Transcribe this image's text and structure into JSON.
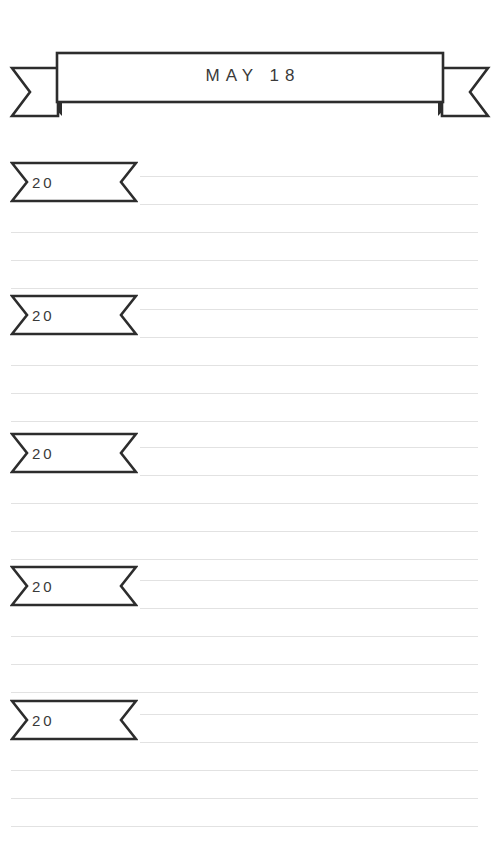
{
  "page": {
    "background_color": "#ffffff",
    "width": 500,
    "height": 855,
    "kind": "memory-book-page"
  },
  "header": {
    "title": "MAY 18",
    "ribbon_icon": "banner-ribbon-icon",
    "stroke_color": "#2d2d2d",
    "text_color": "#3a3a3a"
  },
  "styles": {
    "rule_color": "#e2e2e2",
    "ribbon_stroke": "#2d2d2d",
    "ribbon_fill": "#ffffff"
  },
  "entries": [
    {
      "year_label": "20",
      "ribbon_icon": "year-ribbon-icon",
      "top": 160,
      "rules": [
        {
          "type": "short",
          "y": 16
        },
        {
          "type": "short",
          "y": 44
        },
        {
          "type": "full",
          "y": 72
        },
        {
          "type": "full",
          "y": 100
        },
        {
          "type": "full",
          "y": 128
        }
      ]
    },
    {
      "year_label": "20",
      "ribbon_icon": "year-ribbon-icon",
      "top": 293,
      "rules": [
        {
          "type": "short",
          "y": 16
        },
        {
          "type": "short",
          "y": 44
        },
        {
          "type": "full",
          "y": 72
        },
        {
          "type": "full",
          "y": 100
        },
        {
          "type": "full",
          "y": 128
        }
      ]
    },
    {
      "year_label": "20",
      "ribbon_icon": "year-ribbon-icon",
      "top": 431,
      "rules": [
        {
          "type": "short",
          "y": 16
        },
        {
          "type": "short",
          "y": 44
        },
        {
          "type": "full",
          "y": 72
        },
        {
          "type": "full",
          "y": 100
        },
        {
          "type": "full",
          "y": 128
        }
      ]
    },
    {
      "year_label": "20",
      "ribbon_icon": "year-ribbon-icon",
      "top": 564,
      "rules": [
        {
          "type": "short",
          "y": 16
        },
        {
          "type": "short",
          "y": 44
        },
        {
          "type": "full",
          "y": 72
        },
        {
          "type": "full",
          "y": 100
        },
        {
          "type": "full",
          "y": 128
        }
      ]
    },
    {
      "year_label": "20",
      "ribbon_icon": "year-ribbon-icon",
      "top": 698,
      "rules": [
        {
          "type": "short",
          "y": 16
        },
        {
          "type": "short",
          "y": 44
        },
        {
          "type": "full",
          "y": 72
        },
        {
          "type": "full",
          "y": 100
        },
        {
          "type": "full",
          "y": 128
        }
      ]
    }
  ]
}
